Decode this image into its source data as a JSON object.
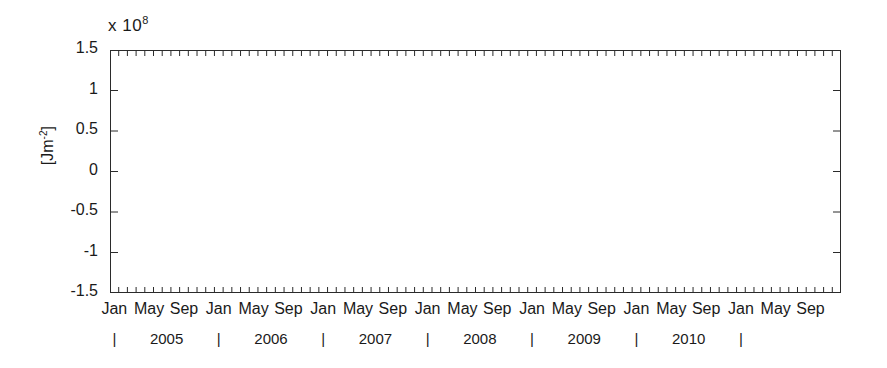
{
  "chart_data": {
    "type": "line",
    "title": "",
    "xlabel": "",
    "ylabel": "[Jm^-2]",
    "ylabel_base": "[Jm",
    "ylabel_sup": "-2",
    "ylabel_close": "]",
    "exponent_prefix": "x 10",
    "exponent_power": "8",
    "y_scale_factor": 100000000.0,
    "ylim": [
      -1.5,
      1.5
    ],
    "ytick_labels": [
      "1.5",
      "1",
      "0.5",
      "0",
      "-0.5",
      "-1",
      "-1.5"
    ],
    "ytick_values": [
      1.5,
      1.0,
      0.5,
      0.0,
      -0.5,
      -1.0,
      -1.5
    ],
    "grid": "vertical-january-only",
    "legend": "none",
    "zero_line": true,
    "x_axis_type": "monthly",
    "x_start": "2004-01",
    "x_end": "2010-12",
    "x_month_ticks_per_year": 12,
    "xtick_month_labels": [
      "Jan",
      "May",
      "Sep",
      "Jan",
      "May",
      "Sep",
      "Jan",
      "May",
      "Sep",
      "Jan",
      "May",
      "Sep",
      "Jan",
      "May",
      "Sep",
      "Jan",
      "May",
      "Sep",
      "Jan",
      "May",
      "Sep"
    ],
    "year_labels": [
      "2005",
      "2006",
      "2007",
      "2008",
      "2009",
      "2010"
    ],
    "year_tick_glyph": "|",
    "year_tick_count": 7,
    "series": [
      {
        "name": "anomaly",
        "color": "#3a3a3a",
        "band_color": "#d9d9d9",
        "units": "Jm^-2 (x10^8)",
        "values": [
          -0.3,
          -0.46,
          -0.74,
          -0.5,
          -0.12,
          -0.55,
          -0.56,
          -0.37,
          -0.3,
          0.02,
          0.22,
          0.27,
          0.28,
          -0.02,
          0.28,
          -0.53,
          -0.5,
          -0.25,
          -0.04,
          -0.01,
          -0.1,
          0.16,
          0.18,
          -0.36,
          -0.63,
          -0.66,
          -0.52,
          -0.58,
          0.33,
          -0.58,
          -0.62,
          -0.55,
          -0.25,
          0.43,
          -0.09,
          0.12,
          0.04,
          0.08,
          0.03,
          0.2,
          0.25,
          0.24,
          0.36,
          0.28,
          0.28,
          0.56,
          0.82,
          1.03,
          0.76,
          0.56,
          0.32,
          0.2,
          0.45,
          0.3,
          0.16,
          0.62,
          0.34,
          0.42,
          0.67,
          0.56,
          0.64,
          0.48,
          0.52,
          0.79,
          0.47,
          0.46,
          0.66,
          0.8,
          0.48,
          0.27,
          0.24,
          -0.19,
          0.1,
          0.55,
          0.9,
          0.92,
          0.48,
          0.58,
          0.3
        ]
      }
    ]
  }
}
